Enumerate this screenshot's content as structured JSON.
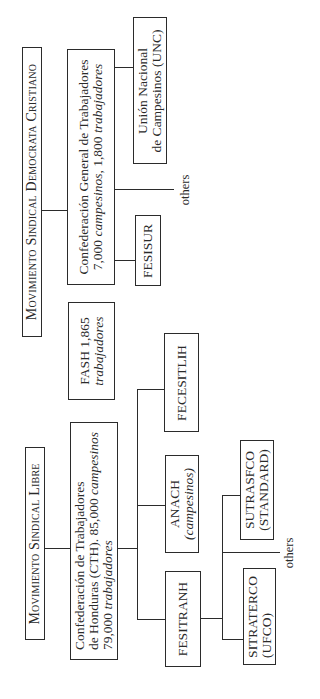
{
  "diagram": {
    "orientation": "rotated-90-ccw",
    "line_color": "#2b2b2b",
    "groups": [
      {
        "id": "msdc",
        "title": "Movimiento Sindical Democrata Cristiano",
        "confederation": {
          "line1": "Confederación General de Trabajadores",
          "line2_num1": "7,000",
          "line2_em1": "campesinos,",
          "line2_num2": "1,800",
          "line2_em2": "trabajadores"
        },
        "children": [
          {
            "name": "FESISUR"
          },
          {
            "name": "others"
          },
          {
            "line1": "Unión Nacional",
            "line2": "de Campesinos (UNC)"
          }
        ]
      },
      {
        "id": "independent",
        "fash": {
          "line1": "FASH 1,865",
          "line2": "trabajadores"
        }
      },
      {
        "id": "msl",
        "title": "Movimiento Sindical Libre",
        "confederation": {
          "line1": "Confederación de Trabajadores",
          "line2_a": "de Honduras (CTH). 85,000",
          "line2_em": "campesinos",
          "line3_num": "79,000",
          "line3_em": "trabajadores"
        },
        "children": [
          {
            "name": "FESITRANH",
            "children": [
              {
                "line1": "SITRATERCO",
                "line2": "(UFCO)"
              },
              {
                "name": "others"
              },
              {
                "line1": "SUTRASFCO",
                "line2": "(STANDARD)"
              }
            ]
          },
          {
            "line1": "ANACH",
            "line2": "(campesinos)"
          },
          {
            "name": "FECESITLIH"
          }
        ]
      }
    ]
  }
}
